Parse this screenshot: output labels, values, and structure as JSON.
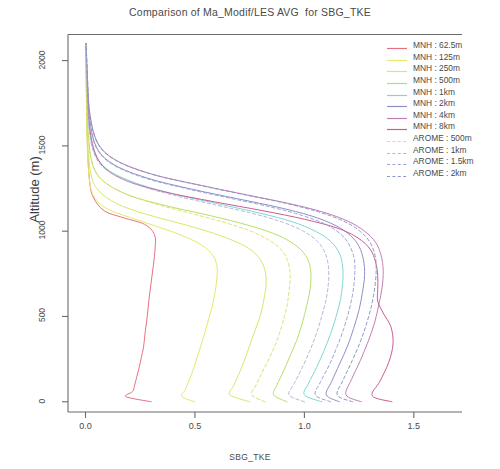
{
  "chart_data": {
    "type": "line",
    "title": "Comparison of Ma_Modif/LES AVG  for SBG_TKE",
    "xlabel": "SBG_TKE",
    "ylabel": "Altitude (m)",
    "xlim": [
      -0.08,
      1.72
    ],
    "ylim": [
      -60,
      2150
    ],
    "xticks": [
      0.0,
      0.5,
      1.0,
      1.5
    ],
    "xticklabels": [
      "0.0",
      "0.5",
      "1.0",
      "1.5"
    ],
    "yticks": [
      0,
      500,
      1000,
      1500,
      2000
    ],
    "yticklabels": [
      "0",
      "500",
      "1000",
      "1500",
      "2000"
    ],
    "grid": false,
    "legend_position": "top-right",
    "orientation": "vertical-profile",
    "series": [
      {
        "name": "MNH : 62.5m",
        "color": "#e8717f",
        "style": "solid",
        "altitude": [
          0,
          30,
          60,
          100,
          150,
          200,
          260,
          320,
          400,
          500,
          600,
          700,
          800,
          900,
          980,
          1040,
          1080,
          1120,
          1200,
          1300,
          1500,
          1750,
          2000,
          2100
        ],
        "tke": [
          0.3,
          0.185,
          0.215,
          0.225,
          0.235,
          0.245,
          0.255,
          0.265,
          0.272,
          0.282,
          0.29,
          0.3,
          0.31,
          0.318,
          0.315,
          0.27,
          0.17,
          0.085,
          0.035,
          0.018,
          0.009,
          0.005,
          0.003,
          0.002
        ]
      },
      {
        "name": "MNH : 125m",
        "color": "#e8e86a",
        "style": "solid",
        "altitude": [
          0,
          30,
          70,
          130,
          200,
          280,
          360,
          450,
          540,
          630,
          720,
          800,
          870,
          930,
          980,
          1030,
          1080,
          1130,
          1200,
          1300,
          1500,
          1750,
          2000,
          2100
        ],
        "tke": [
          0.5,
          0.44,
          0.455,
          0.475,
          0.495,
          0.515,
          0.535,
          0.555,
          0.575,
          0.59,
          0.6,
          0.6,
          0.575,
          0.515,
          0.43,
          0.32,
          0.205,
          0.1,
          0.04,
          0.018,
          0.008,
          0.004,
          0.003,
          0.002
        ]
      },
      {
        "name": "MNH : 250m",
        "color": "#d6e86a",
        "style": "solid",
        "altitude": [
          0,
          40,
          90,
          160,
          240,
          330,
          420,
          510,
          600,
          690,
          770,
          840,
          900,
          950,
          1000,
          1050,
          1100,
          1160,
          1240,
          1340,
          1520,
          1760,
          2000,
          2100
        ],
        "tke": [
          0.75,
          0.66,
          0.675,
          0.7,
          0.725,
          0.75,
          0.775,
          0.8,
          0.815,
          0.825,
          0.82,
          0.795,
          0.745,
          0.665,
          0.555,
          0.42,
          0.275,
          0.145,
          0.058,
          0.024,
          0.01,
          0.005,
          0.003,
          0.002
        ]
      },
      {
        "name": "MNH : 500m",
        "color": "#b6e06a",
        "style": "solid",
        "altitude": [
          0,
          40,
          100,
          180,
          270,
          360,
          460,
          560,
          650,
          740,
          820,
          890,
          950,
          1000,
          1050,
          1100,
          1150,
          1210,
          1290,
          1390,
          1560,
          1790,
          2010,
          2100
        ],
        "tke": [
          0.92,
          0.86,
          0.875,
          0.905,
          0.935,
          0.965,
          0.99,
          1.01,
          1.025,
          1.03,
          1.02,
          0.985,
          0.92,
          0.83,
          0.7,
          0.54,
          0.365,
          0.2,
          0.085,
          0.033,
          0.013,
          0.006,
          0.003,
          0.002
        ]
      },
      {
        "name": "MNH : 1km",
        "color": "#7fd8d0",
        "style": "solid",
        "altitude": [
          0,
          40,
          110,
          200,
          300,
          400,
          500,
          600,
          700,
          790,
          870,
          940,
          1000,
          1055,
          1105,
          1155,
          1210,
          1275,
          1355,
          1455,
          1620,
          1840,
          2030,
          2100
        ],
        "tke": [
          1.08,
          1.0,
          1.02,
          1.055,
          1.09,
          1.12,
          1.145,
          1.165,
          1.175,
          1.175,
          1.16,
          1.12,
          1.05,
          0.945,
          0.8,
          0.625,
          0.43,
          0.245,
          0.108,
          0.042,
          0.016,
          0.007,
          0.003,
          0.002
        ]
      },
      {
        "name": "MNH : 2km",
        "color": "#8f8fc8",
        "style": "solid",
        "altitude": [
          0,
          40,
          120,
          220,
          320,
          430,
          540,
          640,
          740,
          830,
          910,
          975,
          1035,
          1090,
          1140,
          1190,
          1245,
          1310,
          1390,
          1490,
          1655,
          1870,
          2045,
          2100
        ],
        "tke": [
          1.16,
          1.1,
          1.125,
          1.16,
          1.195,
          1.225,
          1.25,
          1.265,
          1.275,
          1.27,
          1.25,
          1.21,
          1.14,
          1.03,
          0.88,
          0.695,
          0.49,
          0.285,
          0.13,
          0.051,
          0.019,
          0.008,
          0.004,
          0.002
        ]
      },
      {
        "name": "MNH : 4km",
        "color": "#c07fb8",
        "style": "solid",
        "altitude": [
          0,
          40,
          130,
          240,
          350,
          460,
          570,
          670,
          770,
          860,
          935,
          1000,
          1058,
          1112,
          1162,
          1212,
          1268,
          1332,
          1412,
          1512,
          1678,
          1890,
          2058,
          2100
        ],
        "tke": [
          1.26,
          1.19,
          1.215,
          1.255,
          1.29,
          1.32,
          1.34,
          1.355,
          1.36,
          1.35,
          1.325,
          1.275,
          1.2,
          1.085,
          0.93,
          0.74,
          0.53,
          0.31,
          0.145,
          0.058,
          0.021,
          0.009,
          0.004,
          0.002
        ]
      },
      {
        "name": "MNH : 8km",
        "color": "#cc5c96",
        "style": "solid",
        "altitude": [
          0,
          35,
          120,
          230,
          340,
          440,
          520,
          590,
          660,
          740,
          820,
          895,
          960,
          1018,
          1070,
          1120,
          1172,
          1232,
          1305,
          1400,
          1560,
          1790,
          2010,
          2100
        ],
        "tke": [
          1.4,
          1.31,
          1.345,
          1.385,
          1.405,
          1.395,
          1.36,
          1.335,
          1.335,
          1.335,
          1.325,
          1.3,
          1.245,
          1.15,
          1.0,
          0.81,
          0.59,
          0.355,
          0.17,
          0.068,
          0.024,
          0.01,
          0.004,
          0.002
        ]
      },
      {
        "name": "AROME : 500m",
        "color": "#e0e06a",
        "style": "dashed",
        "altitude": [
          0,
          40,
          100,
          180,
          270,
          360,
          460,
          560,
          650,
          740,
          820,
          890,
          950,
          1005,
          1055,
          1105,
          1158,
          1220,
          1300,
          1400,
          1570,
          1800,
          2015,
          2100
        ],
        "tke": [
          0.82,
          0.76,
          0.78,
          0.81,
          0.845,
          0.875,
          0.9,
          0.92,
          0.93,
          0.935,
          0.925,
          0.895,
          0.835,
          0.745,
          0.625,
          0.48,
          0.325,
          0.18,
          0.075,
          0.029,
          0.012,
          0.005,
          0.003,
          0.002
        ]
      },
      {
        "name": "AROME : 1km",
        "color": "#b0b8d8",
        "style": "dashed",
        "altitude": [
          0,
          40,
          110,
          200,
          300,
          400,
          505,
          605,
          700,
          790,
          870,
          940,
          1000,
          1055,
          1105,
          1155,
          1210,
          1275,
          1355,
          1455,
          1620,
          1845,
          2035,
          2100
        ],
        "tke": [
          1.0,
          0.93,
          0.955,
          0.99,
          1.025,
          1.055,
          1.08,
          1.1,
          1.11,
          1.11,
          1.095,
          1.06,
          0.995,
          0.895,
          0.76,
          0.59,
          0.405,
          0.23,
          0.1,
          0.039,
          0.015,
          0.006,
          0.003,
          0.002
        ]
      },
      {
        "name": "AROME : 1.5km",
        "color": "#9aa6d0",
        "style": "dashed",
        "altitude": [
          0,
          40,
          120,
          220,
          325,
          430,
          540,
          645,
          745,
          835,
          912,
          978,
          1038,
          1092,
          1142,
          1192,
          1248,
          1312,
          1392,
          1492,
          1660,
          1880,
          2050,
          2100
        ],
        "tke": [
          1.12,
          1.05,
          1.075,
          1.115,
          1.15,
          1.18,
          1.205,
          1.222,
          1.23,
          1.228,
          1.208,
          1.17,
          1.1,
          0.99,
          0.845,
          0.665,
          0.465,
          0.27,
          0.122,
          0.048,
          0.018,
          0.008,
          0.004,
          0.002
        ]
      },
      {
        "name": "AROME : 2km",
        "color": "#8a96c6",
        "style": "dashed",
        "altitude": [
          0,
          40,
          130,
          240,
          350,
          462,
          572,
          675,
          775,
          862,
          938,
          1002,
          1060,
          1114,
          1164,
          1214,
          1270,
          1334,
          1414,
          1514,
          1680,
          1895,
          2060,
          2100
        ],
        "tke": [
          1.22,
          1.15,
          1.178,
          1.218,
          1.255,
          1.285,
          1.308,
          1.322,
          1.328,
          1.322,
          1.298,
          1.252,
          1.178,
          1.062,
          0.912,
          0.725,
          0.518,
          0.302,
          0.14,
          0.056,
          0.02,
          0.009,
          0.004,
          0.002
        ]
      }
    ]
  },
  "legend": {
    "entries": [
      {
        "label": "MNH : 62.5m"
      },
      {
        "label": "MNH : 125m"
      },
      {
        "label": "MNH : 250m"
      },
      {
        "label": "MNH : 500m"
      },
      {
        "label": "MNH : 1km"
      },
      {
        "label": "MNH : 2km"
      },
      {
        "label": "MNH : 4km"
      },
      {
        "label": "MNH : 8km"
      },
      {
        "label": "AROME : 500m"
      },
      {
        "label": "AROME : 1km"
      },
      {
        "label": "AROME : 1.5km"
      },
      {
        "label": "AROME : 2km"
      }
    ]
  },
  "axis_color": "#6b6b6b"
}
